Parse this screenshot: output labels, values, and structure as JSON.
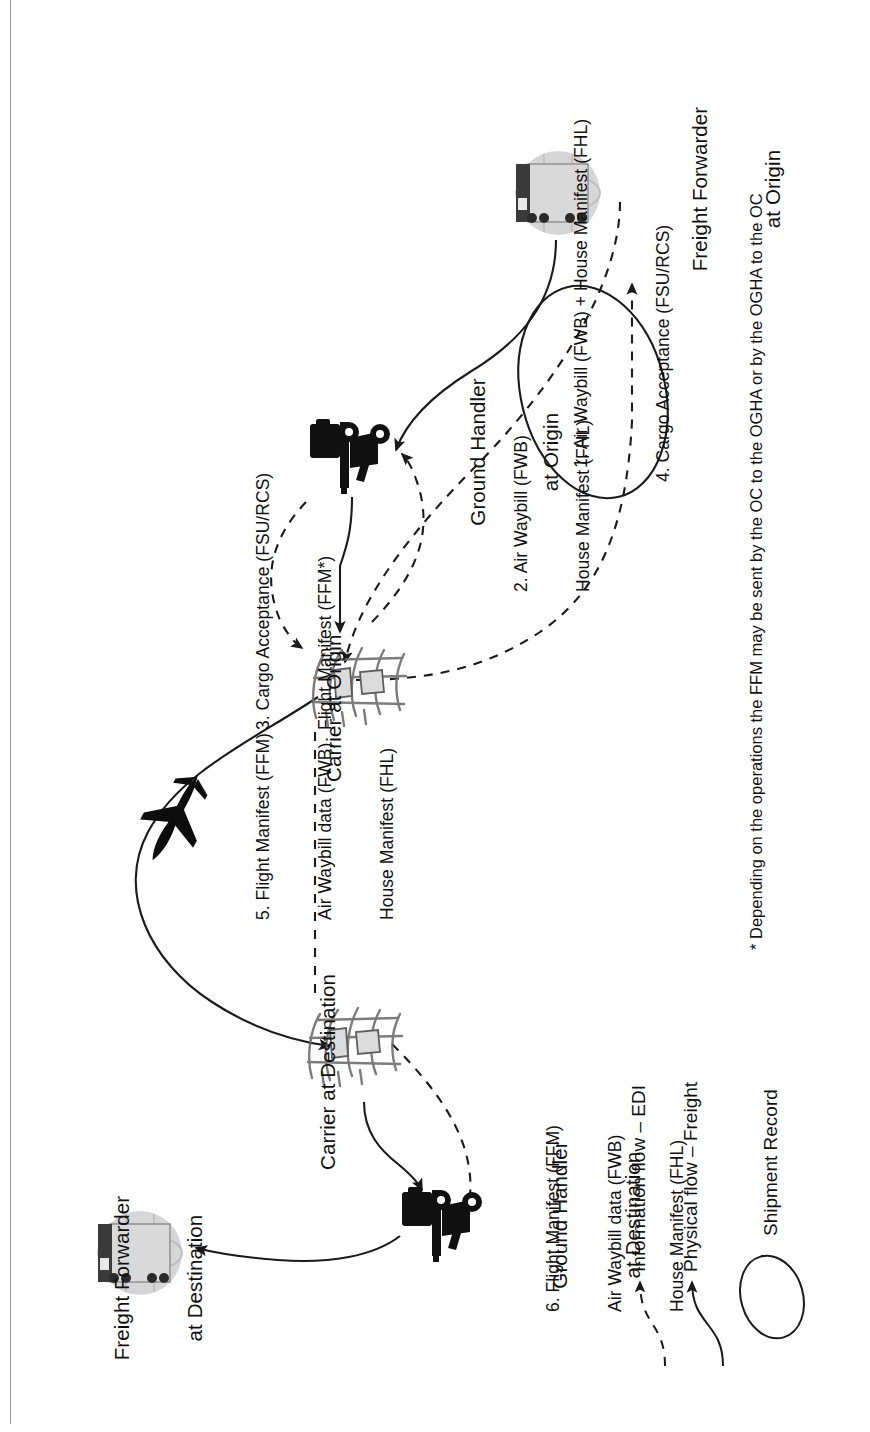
{
  "diagram": {
    "title_visible": false,
    "orientation": "rotated-90-ccw",
    "nodes": [
      {
        "id": "ff-origin",
        "name": "freight-forwarder-at-origin",
        "line1": "Freight Forwarder",
        "line2": "at Origin",
        "icon": "truck-globe-icon"
      },
      {
        "id": "gh-origin",
        "name": "ground-handler-at-origin",
        "line1": "Ground Handler",
        "line2": "at Origin",
        "icon": "forklift-icon"
      },
      {
        "id": "carrier-o",
        "name": "carrier-at-origin",
        "line1": "Carrier at Origin",
        "line2": "",
        "icon": "cargo-plane-loading-icon"
      },
      {
        "id": "carrier-d",
        "name": "carrier-at-destination",
        "line1": "Carrier at Destination",
        "line2": "",
        "icon": "cargo-plane-loading-icon"
      },
      {
        "id": "gh-dest",
        "name": "ground-handler-at-destination",
        "line1": "Ground Handler",
        "line2": "at Destination",
        "icon": "forklift-icon"
      },
      {
        "id": "ff-dest",
        "name": "freight-forwarder-at-destination",
        "line1": "Freight Forwarder",
        "line2": "at Destination",
        "icon": "truck-globe-icon"
      }
    ],
    "flows": [
      {
        "num": "1.",
        "name": "flow-1-air-waybill-house-manifest",
        "lines": [
          "1. Air Waybill (FWB) + House Manifest (FHL)"
        ]
      },
      {
        "num": "2.",
        "name": "flow-2-air-waybill-house-manifest",
        "lines": [
          "2. Air Waybill (FWB)",
          "House Manifest (FHL)"
        ]
      },
      {
        "num": "3.",
        "name": "flow-3-cargo-acceptance-flight-manifest",
        "lines": [
          "3. Cargo Acceptance (FSU/RCS)",
          "Flight Manifest (FFM*)"
        ]
      },
      {
        "num": "4.",
        "name": "flow-4-cargo-acceptance",
        "lines": [
          "4. Cargo Acceptance (FSU/RCS)"
        ]
      },
      {
        "num": "5.",
        "name": "flow-5-flight-manifest",
        "lines": [
          "5. Flight Manifest (FFM)",
          "Air Waybill data (FWB)",
          "House Manifest (FHL)"
        ]
      },
      {
        "num": "6.",
        "name": "flow-6-flight-manifest",
        "lines": [
          "6. Flight Manifest (FFM)",
          "Air Waybill data (FWB)",
          "House Manifest (FHL)"
        ]
      }
    ],
    "in_flight_icon": "airplane-icon",
    "footnote": "* Depending on the operations the FFM may be sent by the OC to the OGHA or by the OGHA to the OC",
    "legend": {
      "shipment_record": "Shipment Record",
      "physical_flow": "Physical flow – Freight",
      "information_flow": "Information flow – EDI"
    },
    "colors": {
      "line": "#1a1a1a",
      "text": "#111111",
      "rule": "#9a9a9a",
      "globe": "#c9c9c9",
      "trailer": "#d6d6d6",
      "cab": "#3b3b3b",
      "plane_sketch": "#6f6f6f"
    }
  }
}
